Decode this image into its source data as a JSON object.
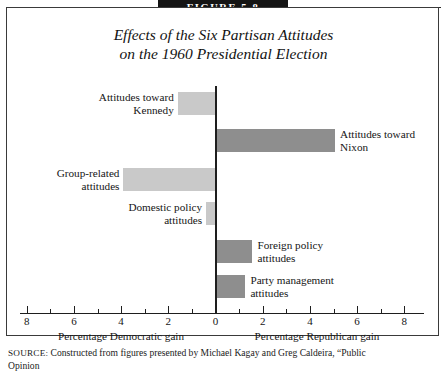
{
  "banner": {
    "label": "FIGURE 5.8"
  },
  "title": {
    "line1": "Effects of the Six Partisan Attitudes",
    "line2": "on the 1960 Presidential Election"
  },
  "axis": {
    "dem_caption": "Percentage Democratic gain",
    "rep_caption": "Percentage Republican gain",
    "tick_labels": [
      "8",
      "6",
      "4",
      "2",
      "0",
      "2",
      "4",
      "6",
      "8"
    ]
  },
  "bars": [
    {
      "label_line1": "Attitudes toward",
      "label_line2": "Kennedy",
      "side": "dem",
      "value": 1.6
    },
    {
      "label_line1": "Attitudes toward",
      "label_line2": "Nixon",
      "side": "rep",
      "value": 5.0
    },
    {
      "label_line1": "Group-related",
      "label_line2": "attitudes",
      "side": "dem",
      "value": 3.9
    },
    {
      "label_line1": "Domestic policy",
      "label_line2": "attitudes",
      "side": "dem",
      "value": 0.4
    },
    {
      "label_line1": "Foreign policy",
      "label_line2": "attitudes",
      "side": "rep",
      "value": 1.5
    },
    {
      "label_line1": "Party management",
      "label_line2": "attitudes",
      "side": "rep",
      "value": 1.2
    }
  ],
  "source": {
    "label": "SOURCE:",
    "line1": "Constructed from figures presented by Michael Kagay and Greg Caldeira, “Public",
    "line2": "Opinion",
    "colors_note": ""
  },
  "chart_data": {
    "type": "bar",
    "orientation": "horizontal-diverging",
    "title": "Effects of the Six Partisan Attitudes on the 1960 Presidential Election",
    "xlabel_left": "Percentage Democratic gain",
    "xlabel_right": "Percentage Republican gain",
    "ylabel": "",
    "xlim": [
      -8,
      8
    ],
    "xticks": [
      -8,
      -6,
      -4,
      -2,
      0,
      2,
      4,
      6,
      8
    ],
    "xtick_labels": [
      "8",
      "6",
      "4",
      "2",
      "0",
      "2",
      "4",
      "6",
      "8"
    ],
    "minor_xticks": [
      -7,
      -5,
      -3,
      -1,
      1,
      3,
      5,
      7
    ],
    "grid": false,
    "legend": "none",
    "categories": [
      "Attitudes toward Kennedy",
      "Attitudes toward Nixon",
      "Group-related attitudes",
      "Domestic policy attitudes",
      "Foreign policy attitudes",
      "Party management attitudes"
    ],
    "values": [
      -1.6,
      5.0,
      -3.9,
      -0.4,
      1.5,
      1.2
    ],
    "value_meaning": "negative = Democratic gain (left), positive = Republican gain (right)",
    "colors": {
      "democratic_bar": "#c9c9c9",
      "republican_bar": "#8e8e8e",
      "axis": "#1e1e1e"
    }
  }
}
